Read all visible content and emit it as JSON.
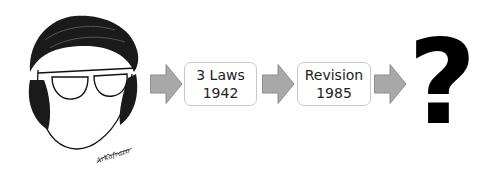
{
  "diagram": {
    "portrait": {
      "description": "caricature sketch of a man with glasses and sideburns",
      "signature": "Arkafrazo"
    },
    "steps": [
      {
        "line1": "3 Laws",
        "line2": "1942"
      },
      {
        "line1": "Revision",
        "line2": "1985"
      }
    ],
    "final": "?",
    "colors": {
      "arrow": "#a8a8a8",
      "arrow_stroke": "#8c8c8c",
      "box_border": "#c8c8c8",
      "text": "#222222"
    }
  }
}
